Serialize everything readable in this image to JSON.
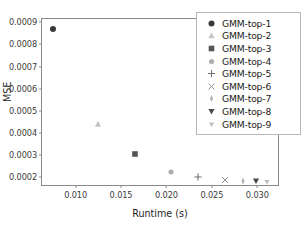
{
  "chart_data": {
    "type": "scatter",
    "title": "",
    "xlabel": "Runtime (s)",
    "ylabel": "MSE",
    "xlim": [
      0.0063,
      0.0325
    ],
    "ylim": [
      0.000155,
      0.000915
    ],
    "xticks": [
      "0.010",
      "0.015",
      "0.020",
      "0.025",
      "0.030"
    ],
    "xtick_values": [
      0.01,
      0.015,
      0.02,
      0.025,
      0.03
    ],
    "yticks": [
      "0.0002",
      "0.0003",
      "0.0004",
      "0.0005",
      "0.0006",
      "0.0007",
      "0.0008",
      "0.0009"
    ],
    "ytick_values": [
      0.0002,
      0.0003,
      0.0004,
      0.0005,
      0.0006,
      0.0007,
      0.0008,
      0.0009
    ],
    "grid": false,
    "legend_position": "upper right",
    "series": [
      {
        "name": "GMM-top-1",
        "marker": "circle-filled",
        "color": "#3a3a3a",
        "x": [
          0.00755
        ],
        "y": [
          0.000868
        ]
      },
      {
        "name": "GMM-top-2",
        "marker": "triangle-up-light",
        "color": "#c4c4c4",
        "x": [
          0.01245
        ],
        "y": [
          0.000442
        ]
      },
      {
        "name": "GMM-top-3",
        "marker": "square-filled",
        "color": "#555555",
        "x": [
          0.0165
        ],
        "y": [
          0.000303
        ]
      },
      {
        "name": "GMM-top-4",
        "marker": "circle-faded",
        "color": "#9e9e9e",
        "x": [
          0.02055
        ],
        "y": [
          0.000222
        ]
      },
      {
        "name": "GMM-top-5",
        "marker": "plus",
        "color": "#6e6e6e",
        "x": [
          0.0235
        ],
        "y": [
          0.0002
        ]
      },
      {
        "name": "GMM-top-6",
        "marker": "cross",
        "color": "#8f8f8f",
        "x": [
          0.0265
        ],
        "y": [
          0.000186
        ]
      },
      {
        "name": "GMM-top-7",
        "marker": "thin-diamond-light",
        "color": "#b0b0b0",
        "x": [
          0.0284
        ],
        "y": [
          0.000183
        ]
      },
      {
        "name": "GMM-top-8",
        "marker": "triangle-down-filled",
        "color": "#4a4a4a",
        "x": [
          0.02985
        ],
        "y": [
          0.000181
        ]
      },
      {
        "name": "GMM-top-9",
        "marker": "triangle-down-light",
        "color": "#bdbdbd",
        "x": [
          0.0311
        ],
        "y": [
          0.000179
        ]
      }
    ]
  },
  "legend": {
    "items": [
      {
        "label": "GMM-top-1"
      },
      {
        "label": "GMM-top-2"
      },
      {
        "label": "GMM-top-3"
      },
      {
        "label": "GMM-top-4"
      },
      {
        "label": "GMM-top-5"
      },
      {
        "label": "GMM-top-6"
      },
      {
        "label": "GMM-top-7"
      },
      {
        "label": "GMM-top-8"
      },
      {
        "label": "GMM-top-9"
      }
    ]
  }
}
